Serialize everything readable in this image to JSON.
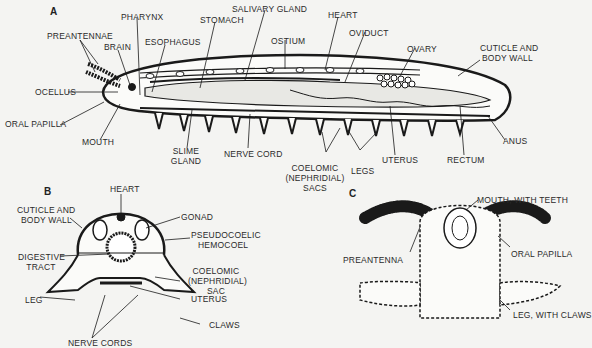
{
  "figure": {
    "panels": [
      {
        "id": "A",
        "title": "A",
        "labels": [
          {
            "key": "preantennae",
            "text": "PREANTENNAE"
          },
          {
            "key": "brain",
            "text": "BRAIN"
          },
          {
            "key": "pharynx",
            "text": "PHARYNX"
          },
          {
            "key": "esophagus",
            "text": "ESOPHAGUS"
          },
          {
            "key": "stomach",
            "text": "STOMACH"
          },
          {
            "key": "salivary_gland",
            "text": "SALIVARY GLAND"
          },
          {
            "key": "ostium",
            "text": "OSTIUM"
          },
          {
            "key": "heart",
            "text": "HEART"
          },
          {
            "key": "oviduct",
            "text": "OVIDUCT"
          },
          {
            "key": "ovary",
            "text": "OVARY"
          },
          {
            "key": "cuticle_1",
            "text": "CUTICLE AND"
          },
          {
            "key": "cuticle_2",
            "text": "BODY WALL"
          },
          {
            "key": "ocellus",
            "text": "OCELLUS"
          },
          {
            "key": "oral_papilla",
            "text": "ORAL PAPILLA"
          },
          {
            "key": "mouth",
            "text": "MOUTH"
          },
          {
            "key": "slime_1",
            "text": "SLIME"
          },
          {
            "key": "slime_2",
            "text": "GLAND"
          },
          {
            "key": "nerve_cord",
            "text": "NERVE CORD"
          },
          {
            "key": "coelomic_1",
            "text": "COELOMIC"
          },
          {
            "key": "coelomic_2",
            "text": "(NEPHRIDIAL)"
          },
          {
            "key": "coelomic_3",
            "text": "SACS"
          },
          {
            "key": "legs",
            "text": "LEGS"
          },
          {
            "key": "uterus",
            "text": "UTERUS"
          },
          {
            "key": "rectum",
            "text": "RECTUM"
          },
          {
            "key": "anus",
            "text": "ANUS"
          }
        ]
      },
      {
        "id": "B",
        "title": "B",
        "labels": [
          {
            "key": "heart",
            "text": "HEART"
          },
          {
            "key": "cuticle_1",
            "text": "CUTICLE AND"
          },
          {
            "key": "cuticle_2",
            "text": "BODY WALL"
          },
          {
            "key": "gonad",
            "text": "GONAD"
          },
          {
            "key": "pseudo_1",
            "text": "PSEUDOCOELIC"
          },
          {
            "key": "pseudo_2",
            "text": "HEMOCOEL"
          },
          {
            "key": "digestive_1",
            "text": "DIGESTIVE"
          },
          {
            "key": "digestive_2",
            "text": "TRACT"
          },
          {
            "key": "coelomic_1",
            "text": "COELOMIC"
          },
          {
            "key": "coelomic_2",
            "text": "(NEPHRIDIAL)"
          },
          {
            "key": "coelomic_3",
            "text": "SAC"
          },
          {
            "key": "leg",
            "text": "LEG"
          },
          {
            "key": "uterus",
            "text": "UTERUS"
          },
          {
            "key": "claws",
            "text": "CLAWS"
          },
          {
            "key": "nerve_cords",
            "text": "NERVE CORDS"
          }
        ]
      },
      {
        "id": "C",
        "title": "C",
        "labels": [
          {
            "key": "mouth",
            "text": "MOUTH, WITH TEETH"
          },
          {
            "key": "preantenna",
            "text": "PREANTENNA"
          },
          {
            "key": "oral_papilla",
            "text": "ORAL PAPILLA"
          },
          {
            "key": "leg",
            "text": "LEG, WITH CLAWS"
          }
        ]
      }
    ],
    "colors": {
      "ink": "#1a1a1a",
      "background": "#f4f4f2",
      "stipple": "#e8e8e4"
    }
  }
}
